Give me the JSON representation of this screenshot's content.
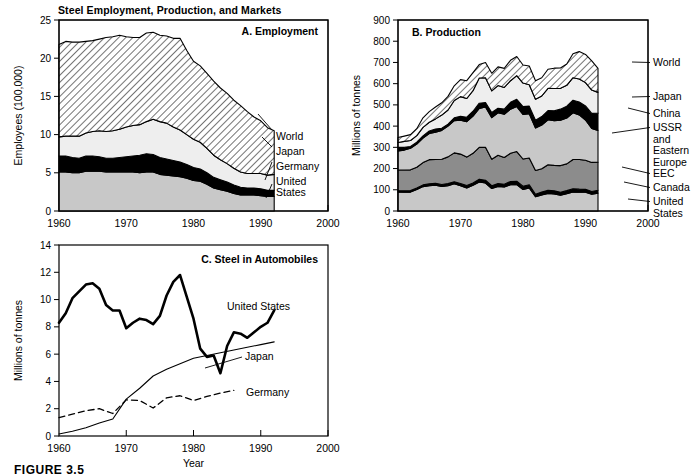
{
  "figure": {
    "title": "Steel Employment, Production, and Markets",
    "caption": "FIGURE 3.5",
    "xlabel": "Year"
  },
  "chart_data": [
    {
      "id": "A",
      "type": "area",
      "title": "A.  Employment",
      "ylabel": "Employees (100,000)",
      "xlabel": "",
      "xlim": [
        1960,
        2000
      ],
      "ylim": [
        0,
        25
      ],
      "xticks": [
        1960,
        1970,
        1980,
        1990,
        2000
      ],
      "yticks": [
        0,
        5,
        10,
        15,
        20,
        25
      ],
      "grid": false,
      "legend_position": "right-inline",
      "stacked": true,
      "x": [
        1960,
        1961,
        1962,
        1963,
        1964,
        1965,
        1966,
        1967,
        1968,
        1969,
        1970,
        1971,
        1972,
        1973,
        1974,
        1975,
        1976,
        1977,
        1978,
        1979,
        1980,
        1981,
        1982,
        1983,
        1984,
        1985,
        1986,
        1987,
        1988,
        1989,
        1990,
        1991,
        1992
      ],
      "series": [
        {
          "name": "United States",
          "fill": "#c8c8c8",
          "values": [
            5.1,
            5.1,
            5.0,
            5.0,
            5.2,
            5.2,
            5.2,
            5.1,
            5.1,
            5.1,
            5.1,
            5.1,
            5.0,
            5.1,
            5.1,
            4.8,
            4.7,
            4.6,
            4.5,
            4.3,
            4.0,
            3.9,
            3.5,
            3.0,
            2.8,
            2.6,
            2.3,
            2.1,
            2.1,
            2.1,
            2.0,
            1.9,
            1.9
          ]
        },
        {
          "name": "Germany",
          "fill": "#000000",
          "values": [
            2.1,
            2.1,
            2.0,
            1.9,
            2.0,
            2.0,
            1.9,
            1.8,
            1.8,
            1.9,
            2.0,
            2.1,
            2.3,
            2.4,
            2.3,
            2.2,
            2.1,
            2.0,
            1.9,
            1.8,
            1.7,
            1.6,
            1.5,
            1.4,
            1.3,
            1.2,
            1.1,
            1.0,
            0.9,
            0.9,
            0.9,
            0.8,
            0.8
          ]
        },
        {
          "name": "Japan",
          "fill": "#eeeeee",
          "values": [
            2.5,
            2.6,
            2.8,
            2.9,
            3.0,
            3.2,
            3.4,
            3.5,
            3.6,
            3.7,
            3.9,
            4.0,
            4.0,
            4.2,
            4.6,
            4.7,
            4.7,
            4.4,
            4.2,
            3.9,
            3.7,
            3.5,
            3.2,
            2.9,
            2.6,
            2.4,
            2.2,
            2.0,
            1.9,
            1.9,
            2.0,
            2.0,
            2.1
          ]
        },
        {
          "name": "World",
          "fill": "hatch",
          "values": [
            12.1,
            12.4,
            12.3,
            12.3,
            12.0,
            11.9,
            12.0,
            12.3,
            12.3,
            12.3,
            11.8,
            11.5,
            11.4,
            11.6,
            11.4,
            11.3,
            11.4,
            11.6,
            12.0,
            11.0,
            10.2,
            10.0,
            9.8,
            9.7,
            9.4,
            9.2,
            8.9,
            8.7,
            8.1,
            7.4,
            6.9,
            6.2,
            5.7
          ]
        }
      ],
      "legend": [
        "World",
        "Japan",
        "Germany",
        "United States"
      ]
    },
    {
      "id": "B",
      "type": "area",
      "title": "B.  Production",
      "ylabel": "Millions of tonnes",
      "xlabel": "",
      "xlim": [
        1960,
        2000
      ],
      "ylim": [
        0,
        900
      ],
      "xticks": [
        1960,
        1970,
        1980,
        1990,
        2000
      ],
      "yticks": [
        0,
        100,
        200,
        300,
        400,
        500,
        600,
        700,
        800,
        900
      ],
      "grid": false,
      "legend_position": "right-inline",
      "stacked": true,
      "x": [
        1960,
        1961,
        1962,
        1963,
        1964,
        1965,
        1966,
        1967,
        1968,
        1969,
        1970,
        1971,
        1972,
        1973,
        1974,
        1975,
        1976,
        1977,
        1978,
        1979,
        1980,
        1981,
        1982,
        1983,
        1984,
        1985,
        1986,
        1987,
        1988,
        1989,
        1990,
        1991,
        1992
      ],
      "series": [
        {
          "name": "United States",
          "fill": "#c8c8c8",
          "values": [
            90,
            89,
            89,
            101,
            115,
            119,
            122,
            116,
            119,
            128,
            119,
            109,
            121,
            137,
            132,
            106,
            116,
            113,
            124,
            124,
            101,
            109,
            67,
            76,
            83,
            80,
            74,
            81,
            90,
            88,
            89,
            79,
            84
          ]
        },
        {
          "name": "Canada",
          "fill": "#000000",
          "values": [
            5,
            6,
            7,
            7,
            8,
            9,
            9,
            9,
            10,
            10,
            11,
            11,
            11,
            13,
            13,
            13,
            13,
            13,
            15,
            16,
            16,
            15,
            12,
            13,
            15,
            15,
            14,
            15,
            15,
            15,
            13,
            13,
            14
          ]
        },
        {
          "name": "EEC",
          "fill": "#8c8c8c",
          "values": [
            98,
            98,
            98,
            98,
            105,
            114,
            112,
            119,
            126,
            136,
            138,
            134,
            140,
            150,
            155,
            125,
            134,
            126,
            133,
            140,
            128,
            126,
            112,
            110,
            120,
            120,
            126,
            126,
            138,
            140,
            137,
            137,
            132
          ]
        },
        {
          "name": "USSR and Eastern Europe",
          "fill": "#c8c8c8",
          "values": [
            90,
            94,
            102,
            109,
            116,
            123,
            128,
            136,
            145,
            152,
            160,
            167,
            175,
            183,
            190,
            196,
            200,
            204,
            208,
            212,
            210,
            208,
            200,
            206,
            212,
            210,
            214,
            216,
            220,
            210,
            190,
            160,
            150
          ]
        },
        {
          "name": "China",
          "fill": "#000000",
          "values": [
            18,
            13,
            8,
            9,
            10,
            12,
            15,
            10,
            9,
            13,
            18,
            21,
            23,
            25,
            21,
            24,
            21,
            24,
            32,
            34,
            37,
            36,
            37,
            40,
            43,
            47,
            52,
            56,
            59,
            61,
            66,
            71,
            81
          ]
        },
        {
          "name": "Japan",
          "fill": "#eeeeee",
          "values": [
            22,
            28,
            28,
            31,
            40,
            41,
            48,
            62,
            67,
            82,
            93,
            88,
            97,
            119,
            117,
            102,
            107,
            102,
            102,
            112,
            111,
            101,
            99,
            97,
            105,
            105,
            98,
            98,
            106,
            108,
            110,
            110,
            98
          ]
        },
        {
          "name": "World",
          "fill": "hatch",
          "values": [
            23,
            25,
            28,
            33,
            45,
            50,
            56,
            58,
            64,
            69,
            80,
            84,
            85,
            63,
            72,
            83,
            88,
            90,
            96,
            90,
            85,
            88,
            87,
            86,
            90,
            96,
            96,
            101,
            113,
            129,
            133,
            137,
            113
          ]
        }
      ],
      "legend": [
        "World",
        "Japan",
        "China",
        "USSR and Eastern Europe",
        "EEC",
        "Canada",
        "United States"
      ],
      "legend_lines": [
        {
          "label": "World",
          "text_lines": [
            "World"
          ]
        },
        {
          "label": "Japan",
          "text_lines": [
            "Japan"
          ]
        },
        {
          "label": "China",
          "text_lines": [
            "China"
          ]
        },
        {
          "label": "USSR and Eastern Europe",
          "text_lines": [
            "USSR",
            "and",
            "Eastern",
            "Europe"
          ]
        },
        {
          "label": "EEC",
          "text_lines": [
            "EEC"
          ]
        },
        {
          "label": "Canada",
          "text_lines": [
            "Canada"
          ]
        },
        {
          "label": "United States",
          "text_lines": [
            "United",
            "States"
          ]
        }
      ]
    },
    {
      "id": "C",
      "type": "line",
      "title": "C.  Steel in Automobiles",
      "ylabel": "Millions of tonnes",
      "xlabel": "Year",
      "xlim": [
        1960,
        2000
      ],
      "ylim": [
        0,
        14
      ],
      "xticks": [
        1960,
        1970,
        1980,
        1990,
        2000
      ],
      "yticks": [
        0,
        2,
        4,
        6,
        8,
        10,
        12,
        14
      ],
      "grid": false,
      "legend_position": "inline-right",
      "series": [
        {
          "name": "United States",
          "style": "thick-solid",
          "color": "#000000",
          "x": [
            1960,
            1961,
            1962,
            1963,
            1964,
            1965,
            1966,
            1967,
            1968,
            1969,
            1970,
            1971,
            1972,
            1973,
            1974,
            1975,
            1976,
            1977,
            1978,
            1979,
            1980,
            1981,
            1982,
            1983,
            1984,
            1985,
            1986,
            1987,
            1988,
            1989,
            1990,
            1991,
            1992
          ],
          "y": [
            8.3,
            9.0,
            10.1,
            10.6,
            11.1,
            11.2,
            10.8,
            9.6,
            9.2,
            9.2,
            7.9,
            8.3,
            8.6,
            8.5,
            8.2,
            8.8,
            10.3,
            11.3,
            11.8,
            10.2,
            8.6,
            6.4,
            5.8,
            5.9,
            4.6,
            6.6,
            7.6,
            7.5,
            7.2,
            7.6,
            8.0,
            8.3,
            9.2
          ]
        },
        {
          "name": "Japan",
          "style": "thin-solid",
          "color": "#000000",
          "x": [
            1960,
            1962,
            1964,
            1966,
            1968,
            1970,
            1972,
            1974,
            1976,
            1978,
            1980,
            1982,
            1984,
            1986,
            1988,
            1990,
            1992
          ],
          "y": [
            0.15,
            0.35,
            0.6,
            0.95,
            1.25,
            2.7,
            3.5,
            4.4,
            4.9,
            5.3,
            5.7,
            5.9,
            6.1,
            6.3,
            6.5,
            6.7,
            6.9
          ]
        },
        {
          "name": "Germany",
          "style": "dashed",
          "color": "#000000",
          "x": [
            1960,
            1962,
            1964,
            1966,
            1968,
            1970,
            1972,
            1974,
            1976,
            1978,
            1980,
            1982,
            1984,
            1986
          ],
          "y": [
            1.35,
            1.6,
            1.85,
            2.0,
            1.65,
            2.65,
            2.6,
            2.05,
            2.8,
            2.95,
            2.6,
            2.9,
            3.15,
            3.35
          ]
        }
      ],
      "legend": [
        "United States",
        "Japan",
        "Germany"
      ]
    }
  ]
}
